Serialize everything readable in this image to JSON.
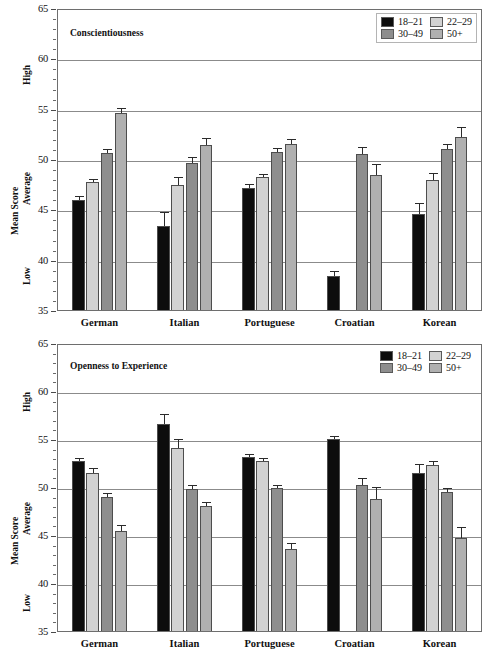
{
  "figure": {
    "background": "#ffffff",
    "series_colors": {
      "18-21": "#0d0d0d",
      "22-29": "#d2d2d2",
      "30-49": "#8e8e8e",
      "50+": "#b0b0b0"
    },
    "axis_anchor_labels": {
      "high": "High",
      "average": "Average",
      "low": "Low"
    }
  },
  "chart_data": [
    {
      "type": "bar",
      "title": "Conscientiousness",
      "xlabel": "",
      "ylabel": "Mean Score",
      "ylim": [
        35,
        65
      ],
      "yticks": [
        35,
        40,
        45,
        50,
        55,
        60,
        65
      ],
      "ytick_labels": [
        "35",
        "40",
        "45",
        "50",
        "55",
        "60",
        "65"
      ],
      "grid": true,
      "legend_position": "top-right",
      "legend_boxed": true,
      "categories": [
        "German",
        "Italian",
        "Portuguese",
        "Croatian",
        "Korean"
      ],
      "series": [
        {
          "name": "18–21",
          "color": "#0d0d0d",
          "values": [
            46.1,
            43.5,
            47.3,
            38.6,
            44.7
          ],
          "errors": [
            0.45,
            1.4,
            0.4,
            0.5,
            1.1
          ]
        },
        {
          "name": "22–29",
          "color": "#d2d2d2",
          "values": [
            47.9,
            47.6,
            48.4,
            null,
            48.1
          ],
          "errors": [
            0.35,
            0.8,
            0.3,
            null,
            0.7
          ]
        },
        {
          "name": "30–49",
          "color": "#8e8e8e",
          "values": [
            50.8,
            49.8,
            50.9,
            50.7,
            51.2
          ],
          "errors": [
            0.35,
            0.6,
            0.4,
            0.7,
            0.5
          ]
        },
        {
          "name": "50+",
          "color": "#b0b0b0",
          "values": [
            54.8,
            51.6,
            51.7,
            48.6,
            52.4
          ],
          "errors": [
            0.45,
            0.7,
            0.5,
            1.1,
            1.0
          ]
        }
      ]
    },
    {
      "type": "bar",
      "title": "Openness to Experience",
      "xlabel": "",
      "ylabel": "Mean Score",
      "ylim": [
        35,
        65
      ],
      "yticks": [
        35,
        40,
        45,
        50,
        55,
        60,
        65
      ],
      "ytick_labels": [
        "35",
        "40",
        "45",
        "50",
        "55",
        "60",
        "65"
      ],
      "grid": true,
      "legend_position": "top-right",
      "legend_boxed": false,
      "categories": [
        "German",
        "Italian",
        "Portuguese",
        "Croatian",
        "Korean"
      ],
      "series": [
        {
          "name": "18–21",
          "color": "#0d0d0d",
          "values": [
            52.9,
            56.8,
            53.3,
            55.2,
            51.7
          ],
          "errors": [
            0.35,
            1.0,
            0.35,
            0.35,
            0.9
          ]
        },
        {
          "name": "22–29",
          "color": "#d2d2d2",
          "values": [
            51.7,
            54.3,
            52.9,
            null,
            52.5
          ],
          "errors": [
            0.45,
            0.9,
            0.35,
            null,
            0.45
          ]
        },
        {
          "name": "30–49",
          "color": "#8e8e8e",
          "values": [
            49.2,
            50.0,
            50.1,
            50.4,
            49.7
          ],
          "errors": [
            0.4,
            0.4,
            0.35,
            0.7,
            0.4
          ]
        },
        {
          "name": "50+",
          "color": "#b0b0b0",
          "values": [
            45.6,
            48.2,
            43.8,
            49.0,
            44.9
          ],
          "errors": [
            0.7,
            0.45,
            0.6,
            1.2,
            1.1
          ]
        }
      ]
    }
  ]
}
